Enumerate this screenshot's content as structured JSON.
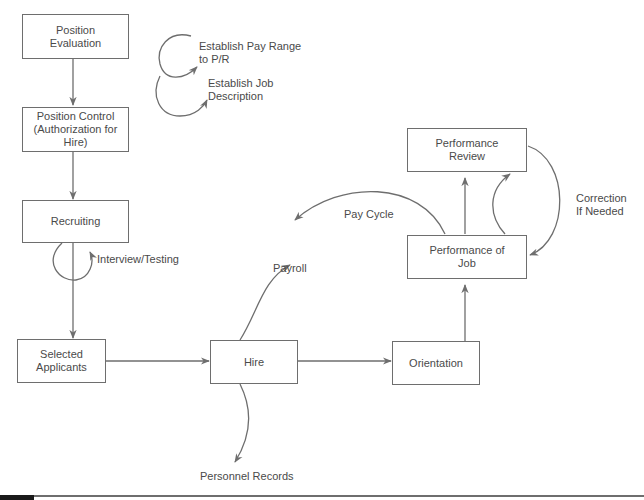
{
  "diagram": {
    "nodes": [
      {
        "id": "position-evaluation",
        "label": "Position\nEvaluation"
      },
      {
        "id": "position-control",
        "label": "Position Control\n(Authorization for Hire)"
      },
      {
        "id": "recruiting",
        "label": "Recruiting"
      },
      {
        "id": "selected-applicants",
        "label": "Selected Applicants"
      },
      {
        "id": "hire",
        "label": "Hire"
      },
      {
        "id": "orientation",
        "label": "Orientation"
      },
      {
        "id": "performance-of-job",
        "label": "Performance of\nJob"
      },
      {
        "id": "performance-review",
        "label": "Performance\nReview"
      }
    ],
    "labels": {
      "establish_pay_range": "Establish Pay Range\nto P/R",
      "establish_job_description": "Establish Job\nDescription",
      "interview_testing": "Interview/Testing",
      "payroll": "Payroll",
      "pay_cycle": "Pay Cycle",
      "correction": "Correction\nIf Needed",
      "personnel_records": "Personnel Records"
    },
    "edges": [
      {
        "from": "position-evaluation",
        "to": "position-control"
      },
      {
        "from": "position-control",
        "to": "recruiting"
      },
      {
        "from": "recruiting",
        "to": "selected-applicants",
        "label": "Interview/Testing"
      },
      {
        "from": "selected-applicants",
        "to": "hire"
      },
      {
        "from": "hire",
        "to": "orientation"
      },
      {
        "from": "hire",
        "to": "payroll"
      },
      {
        "from": "hire",
        "to": "personnel-records"
      },
      {
        "from": "orientation",
        "to": "performance-of-job"
      },
      {
        "from": "performance-of-job",
        "to": "performance-review"
      },
      {
        "from": "performance-of-job",
        "to": "payroll",
        "label": "Pay Cycle"
      },
      {
        "from": "performance-review",
        "to": "performance-of-job",
        "label": "Correction If Needed"
      }
    ]
  },
  "colors": {
    "line": "#6e6e6e",
    "text": "#4a4a4a",
    "background": "#ffffff"
  }
}
